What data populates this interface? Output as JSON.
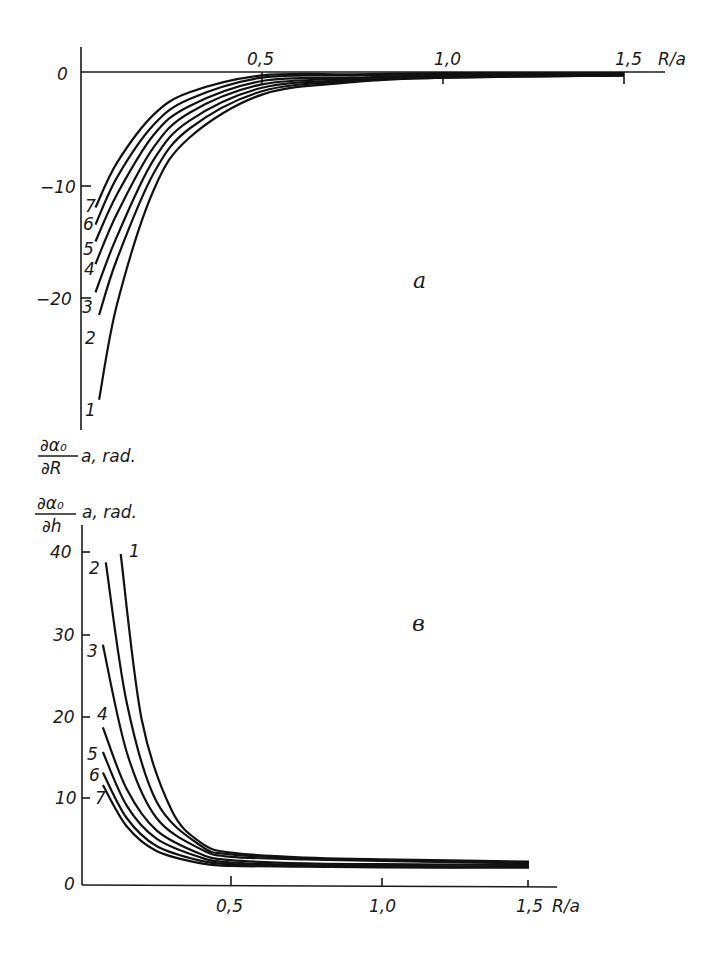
{
  "figure": {
    "panel_a_label": "a",
    "panel_b_label": "в",
    "top_ylabel_num": "∂α₀",
    "top_ylabel_den": "∂R",
    "top_ylabel_suffix": "a, rad.",
    "bottom_ylabel_num": "∂α₀",
    "bottom_ylabel_den": "∂h",
    "bottom_ylabel_suffix": "a, rad.",
    "xlabel": "R/a",
    "top_x_ticks": [
      "0,5",
      "1,0",
      "1,5"
    ],
    "top_y_ticks": [
      "0",
      "−10",
      "−20"
    ],
    "bottom_x_ticks": [
      "0,5",
      "1,0",
      "1,5"
    ],
    "bottom_y_ticks": [
      "0",
      "10",
      "20",
      "30",
      "40"
    ],
    "curve_labels": [
      "1",
      "2",
      "3",
      "4",
      "5",
      "6",
      "7"
    ]
  },
  "chart_data": [
    {
      "type": "line",
      "title": "a",
      "xlabel": "R/a",
      "ylabel": "∂α₀/∂R · a, rad.",
      "xlim": [
        0,
        1.6
      ],
      "ylim": [
        -32,
        2
      ],
      "x_ticks": [
        0.5,
        1.0,
        1.5
      ],
      "y_ticks": [
        0,
        -10,
        -20
      ],
      "grid": false,
      "legend": "curve numbers 1–7 at left ends",
      "series": [
        {
          "name": "1",
          "x": [
            0.05,
            0.1,
            0.2,
            0.3,
            0.5,
            0.75,
            1.0,
            1.5
          ],
          "values": [
            -29.0,
            -20.5,
            -10.5,
            -5.8,
            -2.0,
            -0.9,
            -0.5,
            -0.3
          ]
        },
        {
          "name": "2",
          "x": [
            0.05,
            0.1,
            0.2,
            0.3,
            0.5,
            0.75,
            1.0,
            1.5
          ],
          "values": [
            -21.5,
            -16.5,
            -9.0,
            -5.0,
            -1.7,
            -0.8,
            -0.5,
            -0.3
          ]
        },
        {
          "name": "3",
          "x": [
            0.04,
            0.1,
            0.2,
            0.3,
            0.5,
            0.75,
            1.0,
            1.5
          ],
          "values": [
            -19.5,
            -14.5,
            -7.8,
            -4.3,
            -1.4,
            -0.7,
            -0.4,
            -0.3
          ]
        },
        {
          "name": "4",
          "x": [
            0.04,
            0.1,
            0.2,
            0.3,
            0.5,
            0.75,
            1.0,
            1.5
          ],
          "values": [
            -17.0,
            -12.5,
            -6.7,
            -3.6,
            -1.1,
            -0.6,
            -0.4,
            -0.2
          ]
        },
        {
          "name": "5",
          "x": [
            0.04,
            0.1,
            0.2,
            0.3,
            0.5,
            0.75,
            1.0,
            1.5
          ],
          "values": [
            -15.0,
            -10.8,
            -5.6,
            -3.0,
            -0.8,
            -0.5,
            -0.3,
            -0.2
          ]
        },
        {
          "name": "6",
          "x": [
            0.04,
            0.1,
            0.2,
            0.3,
            0.5,
            0.75,
            1.0,
            1.5
          ],
          "values": [
            -13.5,
            -9.3,
            -4.7,
            -2.4,
            -0.5,
            -0.3,
            -0.2,
            -0.1
          ]
        },
        {
          "name": "7",
          "x": [
            0.04,
            0.1,
            0.2,
            0.3,
            0.5,
            0.75,
            1.0,
            1.5
          ],
          "values": [
            -12.0,
            -8.0,
            -3.8,
            -1.8,
            -0.3,
            -0.2,
            -0.1,
            -0.1
          ]
        }
      ]
    },
    {
      "type": "line",
      "title": "в",
      "xlabel": "R/a",
      "ylabel": "∂α₀/∂h · a, rad.",
      "xlim": [
        0,
        1.6
      ],
      "ylim": [
        0,
        44
      ],
      "x_ticks": [
        0.5,
        1.0,
        1.5
      ],
      "y_ticks": [
        0,
        10,
        20,
        30,
        40
      ],
      "grid": false,
      "legend": "curve numbers 1–7 at upper ends",
      "series": [
        {
          "name": "1",
          "x": [
            0.13,
            0.2,
            0.3,
            0.4,
            0.5,
            0.75,
            1.0,
            1.5
          ],
          "values": [
            40.0,
            20.0,
            9.0,
            5.0,
            3.8,
            3.2,
            3.0,
            2.7
          ]
        },
        {
          "name": "2",
          "x": [
            0.08,
            0.15,
            0.25,
            0.4,
            0.5,
            0.75,
            1.0,
            1.5
          ],
          "values": [
            39.0,
            22.0,
            10.0,
            4.6,
            3.6,
            3.1,
            2.9,
            2.6
          ]
        },
        {
          "name": "3",
          "x": [
            0.07,
            0.15,
            0.25,
            0.4,
            0.5,
            0.75,
            1.0,
            1.5
          ],
          "values": [
            29.0,
            16.0,
            8.0,
            4.2,
            3.3,
            3.0,
            2.8,
            2.5
          ]
        },
        {
          "name": "4",
          "x": [
            0.07,
            0.15,
            0.25,
            0.4,
            0.5,
            0.75,
            1.0,
            1.5
          ],
          "values": [
            19.0,
            11.5,
            6.5,
            3.6,
            2.9,
            2.5,
            2.4,
            2.3
          ]
        },
        {
          "name": "5",
          "x": [
            0.07,
            0.15,
            0.25,
            0.4,
            0.5,
            0.75,
            1.0,
            1.5
          ],
          "values": [
            16.0,
            9.5,
            5.5,
            3.2,
            2.6,
            2.3,
            2.2,
            2.1
          ]
        },
        {
          "name": "6",
          "x": [
            0.07,
            0.15,
            0.25,
            0.4,
            0.5,
            0.75,
            1.0,
            1.5
          ],
          "values": [
            13.5,
            8.0,
            4.6,
            2.8,
            2.4,
            2.2,
            2.1,
            2.0
          ]
        },
        {
          "name": "7",
          "x": [
            0.07,
            0.15,
            0.25,
            0.4,
            0.5,
            0.75,
            1.0,
            1.5
          ],
          "values": [
            12.0,
            7.0,
            4.0,
            2.5,
            2.2,
            2.1,
            2.0,
            2.0
          ]
        }
      ]
    }
  ]
}
